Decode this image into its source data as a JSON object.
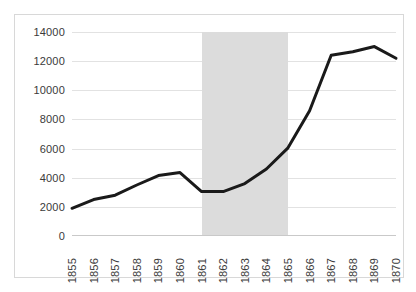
{
  "chart_data": {
    "type": "line",
    "title": "",
    "subtitle": "",
    "xlabel": "",
    "ylabel": "",
    "categories": [
      "1855",
      "1856",
      "1857",
      "1858",
      "1859",
      "1860",
      "1861",
      "1862",
      "1863",
      "1864",
      "1865",
      "1866",
      "1867",
      "1868",
      "1869",
      "1870"
    ],
    "values": [
      1900,
      2500,
      2800,
      3500,
      4150,
      4350,
      3050,
      3050,
      3600,
      4600,
      6050,
      8600,
      12400,
      12650,
      13000,
      12200
    ],
    "series": [
      {
        "name": "series-1",
        "values": [
          1900,
          2500,
          2800,
          3500,
          4150,
          4350,
          3050,
          3050,
          3600,
          4600,
          6050,
          8600,
          12400,
          12650,
          13000,
          12200
        ]
      }
    ],
    "ylim": [
      0,
      14000
    ],
    "yticks": [
      0,
      2000,
      4000,
      6000,
      8000,
      10000,
      12000,
      14000
    ],
    "ytick_labels": [
      "0",
      "2000",
      "4000",
      "6000",
      "8000",
      "10000",
      "12000",
      "14000"
    ],
    "grid": true,
    "legend": false,
    "legend_position": "none",
    "annotations": [
      {
        "type": "shaded-band",
        "label": "",
        "x_start": "1861",
        "x_end": "1865",
        "color": "#dcdcdc"
      }
    ],
    "line_color": "#1a1a1a",
    "line_width": 3,
    "grid_color": "#e2e2e2",
    "background": "#ffffff",
    "border_color": "#d8d8d8"
  }
}
